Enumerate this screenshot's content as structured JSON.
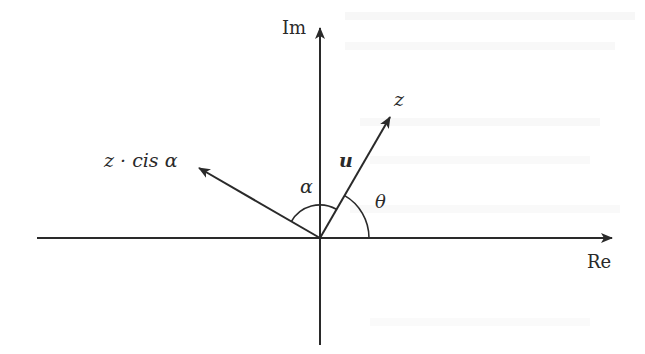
{
  "diagram": {
    "type": "complex-plane-rotation",
    "colors": {
      "background": "#ffffff",
      "ink": "#2a2a2a"
    },
    "origin": {
      "x": 320,
      "y": 238
    },
    "axes": {
      "real": {
        "label": "Re",
        "x_start": 37,
        "x_end": 612
      },
      "imaginary": {
        "label": "Im",
        "y_start": 345,
        "y_end": 28
      }
    },
    "vectors": [
      {
        "id": "z",
        "label": "z",
        "tip": {
          "x": 390,
          "y": 117
        }
      },
      {
        "id": "z-cis-alpha",
        "label": "z · cis α",
        "tip": {
          "x": 199,
          "y": 168
        }
      }
    ],
    "vector_name": {
      "label": "u"
    },
    "angles": [
      {
        "id": "theta",
        "label": "θ",
        "radius": 49
      },
      {
        "id": "alpha",
        "label": "α",
        "radius": 33
      }
    ]
  }
}
